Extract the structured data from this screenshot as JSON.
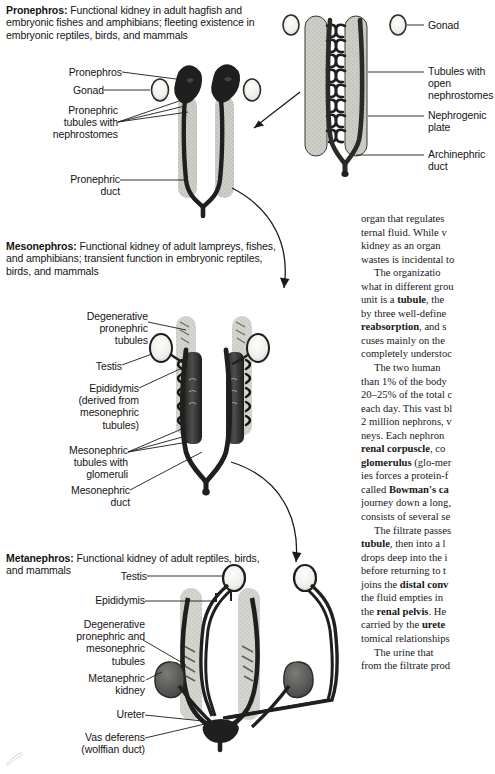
{
  "document": {
    "kind": "textbook-figure-page",
    "colors": {
      "ink": "#141414",
      "body_text": "#18181a",
      "duct_dark": "#2b2b2b",
      "organ_fill_light": "#c9c9c4",
      "organ_fill_mid": "#9a9a95",
      "kidney_fill": "#5a5a58",
      "background": "#ffffff"
    }
  },
  "figure": {
    "panels": [
      {
        "id": "pronephros",
        "caption_lead": "Pronephros:",
        "caption_body": " Functional kidney in adult hagfish and embryonic fishes and amphibians; fleeting existence in embryonic reptiles, birds, and mammals",
        "labels": [
          {
            "name": "pronephros",
            "text": "Pronephros"
          },
          {
            "name": "gonad",
            "text": "Gonad"
          },
          {
            "name": "pronephric-tubules-with-nephrostomes",
            "text": "Pronephric\ntubules with\nnephrostomes"
          },
          {
            "name": "pronephric-duct",
            "text": "Pronephric\nduct"
          }
        ]
      },
      {
        "id": "pronephros-detail",
        "caption_lead": "",
        "caption_body": "",
        "labels": [
          {
            "name": "gonad",
            "text": "Gonad"
          },
          {
            "name": "tubules-with-open-nephrostomes",
            "text": "Tubules with\nopen\nnephrostomes"
          },
          {
            "name": "nephrogenic-plate",
            "text": "Nephrogenic\nplate"
          },
          {
            "name": "archinephric-duct",
            "text": "Archinephric\nduct"
          }
        ]
      },
      {
        "id": "mesonephros",
        "caption_lead": "Mesonephros:",
        "caption_body": " Functional kidney of adult lampreys, fishes, and amphibians; transient function in embryonic reptiles, birds, and mammals",
        "labels": [
          {
            "name": "degenerative-pronephric-tubules",
            "text": "Degenerative\npronephric\ntubules"
          },
          {
            "name": "testis",
            "text": "Testis"
          },
          {
            "name": "epididymis",
            "text": "Epididymis\n(derived from\nmesonephric\ntubules)"
          },
          {
            "name": "mesonephric-tubules-with-glomeruli",
            "text": "Mesonephric\ntubules with\nglomeruli"
          },
          {
            "name": "mesonephric-duct",
            "text": "Mesonephric\nduct"
          }
        ]
      },
      {
        "id": "metanephros",
        "caption_lead": "Metanephros:",
        "caption_body": " Functional kidney of adult reptiles, birds, and mammals",
        "labels": [
          {
            "name": "testis",
            "text": "Testis"
          },
          {
            "name": "epididymis",
            "text": "Epididymis"
          },
          {
            "name": "degenerative-pronephric-and-mesonephric-tubules",
            "text": "Degenerative\npronephric and\nmesonephric\ntubules"
          },
          {
            "name": "metanephric-kidney",
            "text": "Metanephric\nkidney"
          },
          {
            "name": "ureter",
            "text": "Ureter"
          },
          {
            "name": "vas-deferens",
            "text": "Vas deferens\n(wolffian duct)"
          }
        ]
      }
    ]
  },
  "body_text": {
    "paragraphs": [
      "organ that regulates ternal fluid. While v kidney as an organ wastes is incidental to",
      "The organizatio what in different grou unit is a tubule, the by three well-define <b>reabsorption</b>, and s cuses mainly on the completely understoc",
      "The two human than 1% of the body 20–25% of the total c each day. This vast bl 2 million nephrons, v neys. Each nephron <b>renal corpuscle</b>, co <b>glomerulus</b> (glo-mer ies forces a protein-f called <b>Bowman's ca</b> journey down a long, consists of several seɡ The filtrate passes <b>tubule</b>, then into a l drops deep into the i before returning to t joins the <b>distal conv</b> the fluid empties in the <b>renal pelvis</b>. Hе carried by the <b>urete</b> tomical relationships",
      "The urine that from the filtrate prod"
    ],
    "lines": [
      "organ that regulates",
      "ternal fluid. While v",
      "kidney as an organ",
      "wastes is incidental to",
      "The organizatio",
      "what in different grou",
      "unit is a tubule, the",
      "by three well-define",
      "reabsorption, and s",
      "cuses mainly on the",
      "completely understoc",
      "The two human",
      "than 1% of the body",
      "20–25% of the total c",
      "each day. This vast bl",
      "2 million nephrons, v",
      "neys. Each nephron",
      "renal corpuscle, co",
      "glomerulus (glo-mer",
      "ies forces a protein-f",
      "called Bowman's ca",
      "journey down a long,",
      "consists of several se",
      "The filtrate passes",
      "tubule, then into a l",
      "drops deep into the i",
      "before returning to t",
      "joins the distal conv",
      "the fluid empties in",
      "the renal pelvis. He",
      "carried by the urete",
      "tomical relationships",
      "The urine that",
      "from the filtrate prod"
    ]
  }
}
